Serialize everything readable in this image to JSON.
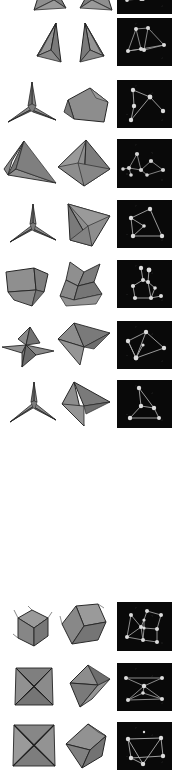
{
  "figure": {
    "background_color": "#ffffff",
    "panel_background_color": "#090909",
    "mesh_fill_color": "#8d8d8d",
    "mesh_edge_color": "#2a2a2a",
    "graph_node_color": "#d8d8d8",
    "graph_edge_color": "#a9a9a9",
    "canvas": {
      "width": 175,
      "height": 781
    },
    "groups": [
      {
        "group_name": "upper-block",
        "label": "",
        "rows": [
          {
            "row_name": "row-1-clipped",
            "y": -34,
            "height": 48,
            "clipped": true,
            "shape_left": "spike-fin-a",
            "shape_right": "spike-fin-b",
            "graph": "two-triangles-clipped",
            "panel": {
              "x": 117,
              "y": -34,
              "w": 55,
              "h": 48
            }
          },
          {
            "row_name": "row-2",
            "y": 18,
            "height": 48,
            "shape_left": "folded-fin-left",
            "shape_right": "folded-fin-right",
            "graph": "two-triangles-linked",
            "panel": {
              "x": 117,
              "y": 18,
              "w": 55,
              "h": 48
            }
          },
          {
            "row_name": "row-3",
            "y": 80,
            "height": 48,
            "shape_left": "three-point-star",
            "shape_right": "slab-quad",
            "graph": "y-branch-four-node",
            "panel": {
              "x": 117,
              "y": 80,
              "w": 55,
              "h": 48
            }
          },
          {
            "row_name": "row-4",
            "y": 139,
            "height": 49,
            "shape_left": "curved-wing",
            "shape_right": "tetra-triangle",
            "graph": "scatter-spokes",
            "panel": {
              "x": 117,
              "y": 139,
              "w": 55,
              "h": 49
            }
          },
          {
            "row_name": "row-5",
            "y": 200,
            "height": 48,
            "shape_left": "three-point-star-2",
            "shape_right": "wedge-triangle",
            "graph": "quad-loop",
            "panel": {
              "x": 117,
              "y": 200,
              "w": 55,
              "h": 48
            }
          },
          {
            "row_name": "row-6",
            "y": 260,
            "height": 48,
            "shape_left": "block-fold",
            "shape_right": "three-fin-curl",
            "graph": "branching-tree",
            "panel": {
              "x": 117,
              "y": 260,
              "w": 55,
              "h": 48
            }
          },
          {
            "row_name": "row-7",
            "y": 321,
            "height": 48,
            "shape_left": "flat-star-fold",
            "shape_right": "arrow-fin",
            "graph": "tilted-quad",
            "panel": {
              "x": 117,
              "y": 321,
              "w": 55,
              "h": 48
            }
          },
          {
            "row_name": "row-8",
            "y": 380,
            "height": 48,
            "shape_left": "three-point-star-3",
            "shape_right": "dart-fin",
            "graph": "tripod-graph",
            "panel": {
              "x": 117,
              "y": 380,
              "w": 55,
              "h": 48
            }
          }
        ]
      },
      {
        "group_name": "lower-block",
        "label": "",
        "rows": [
          {
            "row_name": "row-9",
            "y": 602,
            "height": 49,
            "shape_left": "cube-a",
            "shape_right": "cube-b-rotated",
            "graph": "two-cube-wireframes",
            "panel": {
              "x": 117,
              "y": 602,
              "w": 55,
              "h": 49
            }
          },
          {
            "row_name": "row-10",
            "y": 663,
            "height": 48,
            "shape_left": "four-point-star",
            "shape_right": "folded-bowtie",
            "graph": "crossed-x-graph",
            "panel": {
              "x": 117,
              "y": 663,
              "w": 55,
              "h": 48
            }
          },
          {
            "row_name": "row-11",
            "y": 722,
            "height": 48,
            "shape_left": "four-point-star-2",
            "shape_right": "octahedron-fold",
            "graph": "parallelogram-graph",
            "panel": {
              "x": 117,
              "y": 722,
              "w": 55,
              "h": 48
            }
          }
        ]
      }
    ],
    "whitespace_gap": {
      "y": 445,
      "height": 155
    }
  }
}
